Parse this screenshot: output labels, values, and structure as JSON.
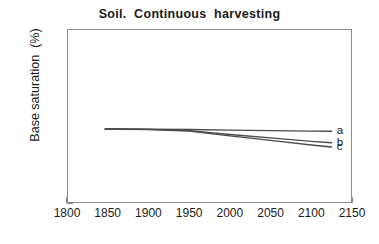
{
  "chart_data": {
    "type": "line",
    "title": "Soil.  Continuous  harvesting",
    "xlabel": "",
    "ylabel": "Base saturation  (%)",
    "xlim": [
      1800,
      2150
    ],
    "ylim": [
      0,
      100
    ],
    "xticks": [
      1800,
      1850,
      1900,
      1950,
      2000,
      2050,
      2100,
      2150
    ],
    "yticks": [
      0,
      20,
      40,
      60,
      80,
      100
    ],
    "grid": false,
    "legend_position": "right-inline",
    "series": [
      {
        "name": "a",
        "label": "a",
        "color": "#4a4a4a",
        "x": [
          1847,
          1900,
          1950,
          2000,
          2050,
          2100,
          2125
        ],
        "values": [
          42.5,
          42.4,
          42.2,
          41.9,
          41.6,
          41.3,
          41.2
        ]
      },
      {
        "name": "b",
        "label": "b",
        "color": "#4a4a4a",
        "x": [
          1847,
          1900,
          1950,
          2000,
          2050,
          2100,
          2125
        ],
        "values": [
          42.5,
          42.3,
          41.6,
          39.4,
          37.4,
          35.4,
          34.6
        ]
      },
      {
        "name": "c",
        "label": "c",
        "color": "#4a4a4a",
        "x": [
          1847,
          1900,
          1950,
          2000,
          2050,
          2100,
          2125
        ],
        "values": [
          42.5,
          42.2,
          41.3,
          38.6,
          36.0,
          33.3,
          32.2
        ]
      }
    ]
  },
  "axes": {
    "x_tick_labels": [
      "1800",
      "1850",
      "1900",
      "1950",
      "2000",
      "2050",
      "2100",
      "2150"
    ],
    "y_tick_labels": [
      "0",
      "20",
      "40",
      "60",
      "80",
      "100"
    ]
  },
  "style": {
    "axis_color": "#8a8a8a",
    "line_color": "#4a4a4a",
    "text_color": "#1a1a1a",
    "background": "#ffffff"
  }
}
